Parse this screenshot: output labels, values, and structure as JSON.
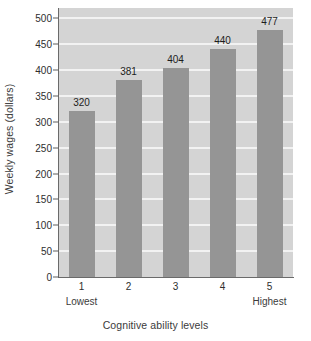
{
  "chart_data": {
    "type": "bar",
    "title": "",
    "subtitle": "",
    "categories": [
      "1",
      "2",
      "3",
      "4",
      "5"
    ],
    "category_sublabels": [
      "Lowest",
      "",
      "",
      "",
      "Highest"
    ],
    "values": [
      320,
      381,
      404,
      440,
      477
    ],
    "data_labels": [
      "320",
      "381",
      "404",
      "440",
      "477"
    ],
    "xlabel": "Cognitive ability levels",
    "ylabel": "Weekly wages (dollars)",
    "ylim": [
      0,
      520
    ],
    "yticks": [
      0,
      50,
      100,
      150,
      200,
      250,
      300,
      350,
      400,
      450,
      500
    ],
    "ytick_labels": [
      "0",
      "50",
      "100",
      "150",
      "200",
      "250",
      "300",
      "350",
      "400",
      "450",
      "500"
    ],
    "grid": "horizontal",
    "legend": "none",
    "colors": {
      "bar": "#959595",
      "plot_background": "#d4d4d4",
      "gridline": "#f2f2f2",
      "axis": "#6a6a6a",
      "page_background": "#ffffff",
      "text": "#2e2e2e"
    }
  }
}
